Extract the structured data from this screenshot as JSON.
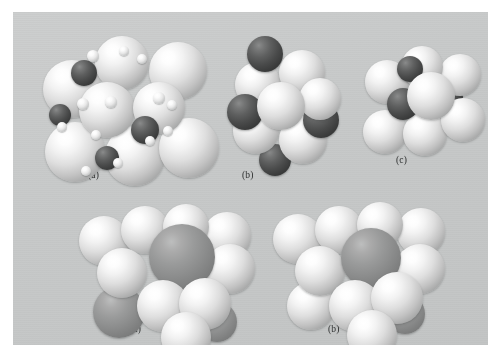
{
  "figure": {
    "kind": "crystal-structure-space-filling-models",
    "plate_background_color": "#c9cbcb",
    "page_background_color": "#ffffff",
    "sphere_colors": {
      "large_light": "#f0f0f0",
      "dark": "#3b3c3c",
      "mid_grey": "#8b8c8c",
      "tiny_light": "#ededed"
    },
    "rows": [
      {
        "row_index": 0,
        "panels": [
          {
            "caption": "(a)",
            "caption_x": 88,
            "caption_y": 170
          },
          {
            "caption": "(b)",
            "caption_x": 242,
            "caption_y": 170
          },
          {
            "caption": "(c)",
            "caption_x": 396,
            "caption_y": 155
          }
        ]
      },
      {
        "row_index": 1,
        "panels": [
          {
            "caption": "(a)",
            "caption_x": 130,
            "caption_y": 324
          },
          {
            "caption": "(b)",
            "caption_x": 328,
            "caption_y": 324
          }
        ]
      }
    ],
    "captions": {
      "top_a": "(a)",
      "top_b": "(b)",
      "top_c": "(c)",
      "bottom_a": "(a)",
      "bottom_b": "(b)"
    }
  },
  "models": {
    "top_a": {
      "name": "model-top-a",
      "spheres": [
        {
          "x": 10,
          "y": 34,
          "r": 29,
          "type": "lite",
          "z": 3
        },
        {
          "x": 62,
          "y": 10,
          "r": 27,
          "type": "lite",
          "z": 4
        },
        {
          "x": 116,
          "y": 16,
          "r": 29,
          "type": "lite",
          "z": 3
        },
        {
          "x": 12,
          "y": 96,
          "r": 30,
          "type": "lite",
          "z": 2
        },
        {
          "x": 72,
          "y": 100,
          "r": 30,
          "type": "lite",
          "z": 2
        },
        {
          "x": 126,
          "y": 92,
          "r": 30,
          "type": "lite",
          "z": 2
        },
        {
          "x": 46,
          "y": 56,
          "r": 28,
          "type": "lite",
          "z": 6
        },
        {
          "x": 100,
          "y": 56,
          "r": 26,
          "type": "lite",
          "z": 6
        },
        {
          "x": 38,
          "y": 34,
          "r": 13,
          "type": "dark",
          "z": 5
        },
        {
          "x": 98,
          "y": 90,
          "r": 14,
          "type": "dark",
          "z": 7
        },
        {
          "x": 16,
          "y": 78,
          "r": 11,
          "type": "dark",
          "z": 5
        },
        {
          "x": 62,
          "y": 120,
          "r": 12,
          "type": "dark",
          "z": 7
        },
        {
          "x": 128,
          "y": 44,
          "r": 11,
          "type": "dark",
          "z": 1
        },
        {
          "x": 54,
          "y": 24,
          "r": 6,
          "type": "tiny",
          "z": 9
        },
        {
          "x": 86,
          "y": 20,
          "r": 5,
          "type": "tiny",
          "z": 9
        },
        {
          "x": 104,
          "y": 28,
          "r": 5,
          "type": "tiny",
          "z": 9
        },
        {
          "x": 44,
          "y": 72,
          "r": 6,
          "type": "tiny",
          "z": 9
        },
        {
          "x": 72,
          "y": 70,
          "r": 6,
          "type": "tiny",
          "z": 9
        },
        {
          "x": 120,
          "y": 66,
          "r": 6,
          "type": "tiny",
          "z": 9
        },
        {
          "x": 134,
          "y": 74,
          "r": 5,
          "type": "tiny",
          "z": 9
        },
        {
          "x": 24,
          "y": 96,
          "r": 5,
          "type": "tiny",
          "z": 9
        },
        {
          "x": 58,
          "y": 104,
          "r": 5,
          "type": "tiny",
          "z": 9
        },
        {
          "x": 112,
          "y": 110,
          "r": 5,
          "type": "tiny",
          "z": 9
        },
        {
          "x": 130,
          "y": 100,
          "r": 5,
          "type": "tiny",
          "z": 9
        },
        {
          "x": 80,
          "y": 132,
          "r": 5,
          "type": "tiny",
          "z": 9
        },
        {
          "x": 48,
          "y": 140,
          "r": 5,
          "type": "tiny",
          "z": 9
        }
      ]
    },
    "top_b": {
      "name": "model-top-b",
      "spheres": [
        {
          "x": 8,
          "y": 30,
          "r": 23,
          "type": "lite",
          "z": 3
        },
        {
          "x": 52,
          "y": 18,
          "r": 23,
          "type": "lite",
          "z": 4
        },
        {
          "x": 6,
          "y": 76,
          "r": 23,
          "type": "lite",
          "z": 2
        },
        {
          "x": 52,
          "y": 84,
          "r": 24,
          "type": "lite",
          "z": 2
        },
        {
          "x": 30,
          "y": 50,
          "r": 24,
          "type": "lite",
          "z": 6
        },
        {
          "x": 72,
          "y": 46,
          "r": 21,
          "type": "lite",
          "z": 5
        },
        {
          "x": 20,
          "y": 4,
          "r": 18,
          "type": "dark",
          "z": 4
        },
        {
          "x": 0,
          "y": 62,
          "r": 18,
          "type": "dark",
          "z": 3
        },
        {
          "x": 76,
          "y": 70,
          "r": 18,
          "type": "dark",
          "z": 3
        },
        {
          "x": 32,
          "y": 112,
          "r": 16,
          "type": "dark",
          "z": 1
        }
      ]
    },
    "top_c": {
      "name": "model-top-c",
      "spheres": [
        {
          "x": 4,
          "y": 24,
          "r": 22,
          "type": "lite",
          "z": 3
        },
        {
          "x": 40,
          "y": 10,
          "r": 21,
          "type": "lite",
          "z": 4
        },
        {
          "x": 78,
          "y": 18,
          "r": 21,
          "type": "lite",
          "z": 3
        },
        {
          "x": 2,
          "y": 74,
          "r": 22,
          "type": "lite",
          "z": 2
        },
        {
          "x": 42,
          "y": 76,
          "r": 22,
          "type": "lite",
          "z": 2
        },
        {
          "x": 80,
          "y": 62,
          "r": 22,
          "type": "lite",
          "z": 2
        },
        {
          "x": 46,
          "y": 36,
          "r": 24,
          "type": "lite",
          "z": 6
        },
        {
          "x": 36,
          "y": 20,
          "r": 13,
          "type": "dark",
          "z": 5
        },
        {
          "x": 26,
          "y": 52,
          "r": 16,
          "type": "dark",
          "z": 5
        },
        {
          "x": 76,
          "y": 48,
          "r": 13,
          "type": "dark",
          "z": 1
        }
      ]
    },
    "bottom_a": {
      "name": "model-bottom-a",
      "spheres": [
        {
          "x": 4,
          "y": 18,
          "r": 25,
          "type": "lite",
          "z": 3
        },
        {
          "x": 46,
          "y": 8,
          "r": 24,
          "type": "lite",
          "z": 4
        },
        {
          "x": 88,
          "y": 6,
          "r": 23,
          "type": "lite",
          "z": 4
        },
        {
          "x": 128,
          "y": 14,
          "r": 24,
          "type": "lite",
          "z": 3
        },
        {
          "x": 22,
          "y": 50,
          "r": 25,
          "type": "lite",
          "z": 5
        },
        {
          "x": 130,
          "y": 46,
          "r": 25,
          "type": "lite",
          "z": 5
        },
        {
          "x": 62,
          "y": 82,
          "r": 26,
          "type": "lite",
          "z": 6
        },
        {
          "x": 104,
          "y": 80,
          "r": 26,
          "type": "lite",
          "z": 6
        },
        {
          "x": 86,
          "y": 114,
          "r": 25,
          "type": "lite",
          "z": 7
        },
        {
          "x": 74,
          "y": 26,
          "r": 33,
          "type": "mid",
          "z": 5
        },
        {
          "x": 18,
          "y": 88,
          "r": 26,
          "type": "mid",
          "z": 4
        },
        {
          "x": 122,
          "y": 104,
          "r": 20,
          "type": "mid",
          "z": 2
        }
      ]
    },
    "bottom_b": {
      "name": "model-bottom-b",
      "spheres": [
        {
          "x": 2,
          "y": 16,
          "r": 25,
          "type": "lite",
          "z": 3
        },
        {
          "x": 44,
          "y": 8,
          "r": 24,
          "type": "lite",
          "z": 4
        },
        {
          "x": 86,
          "y": 4,
          "r": 23,
          "type": "lite",
          "z": 4
        },
        {
          "x": 126,
          "y": 10,
          "r": 24,
          "type": "lite",
          "z": 3
        },
        {
          "x": 24,
          "y": 48,
          "r": 25,
          "type": "lite",
          "z": 5
        },
        {
          "x": 124,
          "y": 46,
          "r": 25,
          "type": "lite",
          "z": 5
        },
        {
          "x": 58,
          "y": 82,
          "r": 26,
          "type": "lite",
          "z": 6
        },
        {
          "x": 100,
          "y": 74,
          "r": 26,
          "type": "lite",
          "z": 6
        },
        {
          "x": 76,
          "y": 112,
          "r": 25,
          "type": "lite",
          "z": 7
        },
        {
          "x": 16,
          "y": 84,
          "r": 24,
          "type": "lite",
          "z": 4
        },
        {
          "x": 70,
          "y": 30,
          "r": 30,
          "type": "mid",
          "z": 5
        },
        {
          "x": 114,
          "y": 96,
          "r": 20,
          "type": "mid",
          "z": 2
        }
      ]
    }
  },
  "layout": {
    "panels": [
      {
        "key": "top_a",
        "left": 20,
        "top": 14,
        "width": 170,
        "height": 150
      },
      {
        "key": "top_b",
        "left": 214,
        "top": 20,
        "width": 120,
        "height": 140
      },
      {
        "key": "top_c",
        "left": 348,
        "top": 24,
        "width": 120,
        "height": 130
      },
      {
        "key": "bottom_a",
        "left": 62,
        "top": 186,
        "width": 180,
        "height": 145
      },
      {
        "key": "bottom_b",
        "left": 258,
        "top": 186,
        "width": 180,
        "height": 145
      }
    ]
  }
}
